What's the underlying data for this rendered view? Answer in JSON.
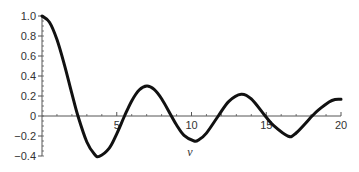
{
  "chart_data": {
    "type": "line",
    "title": "",
    "xlabel": "v",
    "ylabel": "",
    "xlim": [
      0,
      20
    ],
    "ylim": [
      -0.4,
      1.0
    ],
    "grid": false,
    "legend": null,
    "x_ticks": [
      5,
      10,
      15,
      20
    ],
    "x_tick_labels": [
      "5",
      "10",
      "15",
      "20"
    ],
    "y_ticks": [
      1.0,
      0.8,
      0.6,
      0.4,
      0.2,
      0,
      -0.2,
      -0.4
    ],
    "y_tick_labels": [
      "1.0",
      "0.8",
      "0.6",
      "0.4",
      "0.2",
      "0",
      "−0.2",
      "−0.4"
    ],
    "series": [
      {
        "name": "J0(v)",
        "color": "#111111",
        "x": [
          0,
          0.5,
          1,
          1.5,
          2,
          2.405,
          3,
          3.5,
          3.832,
          4.5,
          5,
          5.52,
          6,
          6.5,
          7.016,
          7.5,
          8,
          8.654,
          9,
          9.5,
          10.173,
          10.5,
          11,
          11.79,
          12.5,
          13.324,
          14,
          14.931,
          15.5,
          16.471,
          17,
          18.071,
          18.5,
          19.2,
          19.6,
          20
        ],
        "values": [
          1.0,
          0.938,
          0.765,
          0.512,
          0.224,
          0.0,
          -0.26,
          -0.38,
          -0.403,
          -0.321,
          -0.178,
          0.0,
          0.151,
          0.26,
          0.3,
          0.266,
          0.172,
          0.0,
          -0.09,
          -0.194,
          -0.25,
          -0.237,
          -0.171,
          0.0,
          0.147,
          0.218,
          0.171,
          0.0,
          -0.097,
          -0.202,
          -0.17,
          0.0,
          0.061,
          0.14,
          0.165,
          0.167
        ]
      }
    ]
  }
}
